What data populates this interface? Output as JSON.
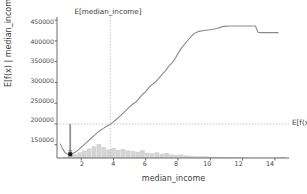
{
  "chart_data": {
    "type": "line",
    "title": "",
    "xlabel": "median_income",
    "ylabel": "E[f(x) | median_income]",
    "xlim": [
      0.5,
      15.0
    ],
    "ylim": [
      118000,
      460000
    ],
    "grid": false,
    "legend_position": "none",
    "xticks": [
      2,
      4,
      6,
      8,
      10,
      12,
      14
    ],
    "xtick_labels": [
      "2",
      "4",
      "6",
      "8",
      "10",
      "12",
      "14"
    ],
    "yticks": [
      150000,
      200000,
      250000,
      300000,
      350000,
      400000,
      450000
    ],
    "ytick_labels": [
      "150000",
      "200000",
      "250000",
      "300000",
      "350000",
      "400000",
      "450000"
    ],
    "series": [
      {
        "name": "E[f(x) | median_income]",
        "color": "#8a8a8a",
        "x": [
          0.7,
          0.85,
          1.0,
          1.15,
          1.3,
          1.45,
          1.6,
          1.8,
          2.0,
          2.2,
          2.4,
          2.6,
          2.8,
          3.0,
          3.2,
          3.4,
          3.6,
          3.8,
          4.0,
          4.2,
          4.4,
          4.6,
          4.8,
          5.0,
          5.2,
          5.4,
          5.6,
          5.8,
          6.0,
          6.2,
          6.4,
          6.6,
          6.8,
          7.0,
          7.2,
          7.4,
          7.6,
          7.8,
          8.0,
          8.2,
          8.4,
          8.6,
          8.8,
          9.0,
          9.3,
          9.6,
          10.0,
          10.4,
          10.8,
          11.2,
          11.6,
          12.0,
          12.4,
          12.8,
          12.95,
          13.1,
          13.6,
          14.2
        ],
        "y": [
          152000,
          140000,
          131000,
          127000,
          126500,
          128000,
          131000,
          137000,
          144000,
          151000,
          158000,
          165000,
          172000,
          179000,
          185000,
          190000,
          195000,
          199000,
          205000,
          212000,
          219000,
          226000,
          234000,
          241000,
          248000,
          253000,
          262000,
          271000,
          278000,
          288000,
          295000,
          301000,
          310000,
          319000,
          327000,
          338000,
          346000,
          356000,
          370000,
          382000,
          392000,
          401000,
          410000,
          418000,
          423000,
          425000,
          427000,
          430000,
          435000,
          436000,
          436000,
          436000,
          436000,
          436000,
          421000,
          420000,
          420000,
          420000
        ]
      }
    ],
    "histogram": {
      "name": "median_income distribution",
      "color": "#d4d4d4",
      "bin_left": [
        0.85,
        1.15,
        1.45,
        1.75,
        2.05,
        2.35,
        2.65,
        2.95,
        3.25,
        3.55,
        3.85,
        4.15,
        4.45,
        4.75,
        5.05,
        5.35,
        5.65,
        5.95,
        6.25,
        6.55,
        6.85,
        7.15,
        7.45,
        7.75,
        8.05,
        8.35,
        8.65,
        8.95,
        9.25,
        9.55,
        9.85,
        10.15,
        10.45,
        10.75,
        11.05,
        11.35,
        11.65,
        11.95,
        12.25,
        12.55,
        12.85,
        13.15,
        13.45,
        13.75,
        14.05,
        14.35
      ],
      "bin_width": 0.3,
      "counts": [
        0.06,
        0.14,
        0.26,
        0.4,
        0.54,
        0.68,
        0.84,
        1.0,
        0.78,
        0.62,
        0.72,
        0.58,
        0.64,
        0.54,
        0.5,
        0.44,
        0.56,
        0.38,
        0.34,
        0.4,
        0.3,
        0.36,
        0.26,
        0.22,
        0.26,
        0.18,
        0.16,
        0.14,
        0.12,
        0.13,
        0.1,
        0.09,
        0.08,
        0.07,
        0.07,
        0.06,
        0.05,
        0.05,
        0.04,
        0.04,
        0.04,
        0.03,
        0.03,
        0.03,
        0.03,
        0.08
      ]
    },
    "annotations": {
      "vline": {
        "label": "E[median_income]",
        "x_value": 3.8,
        "style": "dotted",
        "color": "#b5b5b5"
      },
      "hline": {
        "label": "E[f(x)]",
        "y_value": 200000,
        "style": "dashed",
        "color": "#b5b5b5"
      },
      "arrow": {
        "x_value": 1.32,
        "y_from": 200000,
        "y_to": 128500,
        "color": "#8c8c8c"
      },
      "marker": {
        "x_value": 1.32,
        "y_value": 127000,
        "shape": "square",
        "color": "#1a1a1a"
      }
    },
    "axis_color": "#5a5a5a"
  }
}
